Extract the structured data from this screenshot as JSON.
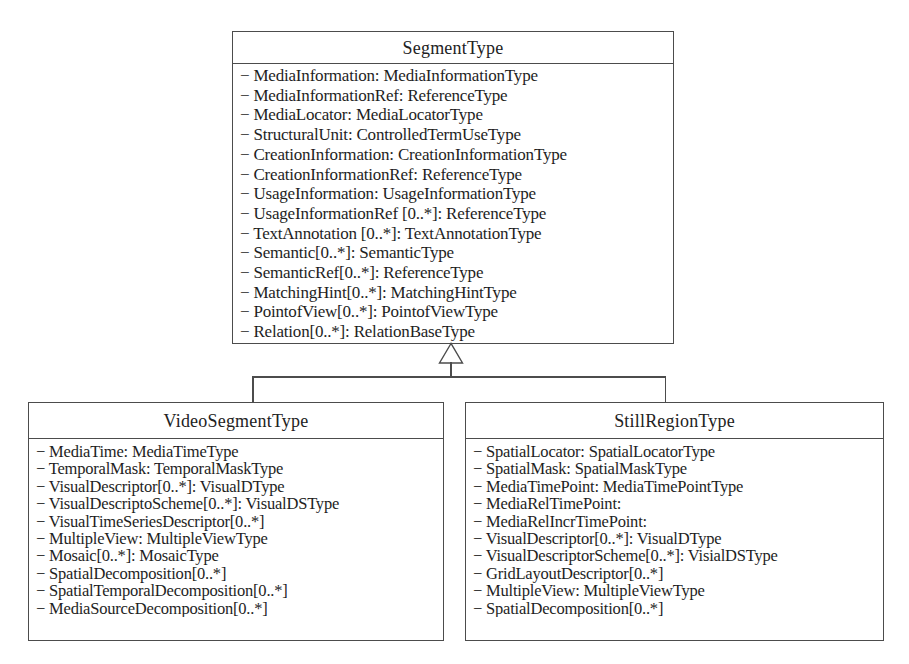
{
  "diagram": {
    "type": "uml-class-diagram",
    "background_color": "#ffffff",
    "line_color": "#4c4c4c",
    "text_color": "#1e1e1e",
    "classes": [
      {
        "name": "SegmentType",
        "attributes": [
          "− MediaInformation: MediaInformationType",
          "− MediaInformationRef: ReferenceType",
          "− MediaLocator: MediaLocatorType",
          "− StructuralUnit: ControlledTermUseType",
          "− CreationInformation: CreationInformationType",
          "− CreationInformationRef: ReferenceType",
          "− UsageInformation: UsageInformationType",
          "− UsageInformationRef [0..*]: ReferenceType",
          "− TextAnnotation [0..*]: TextAnnotationType",
          "− Semantic[0..*]: SemanticType",
          "− SemanticRef[0..*]: ReferenceType",
          "− MatchingHint[0..*]: MatchingHintType",
          "− PointofView[0..*]: PointofViewType",
          "− Relation[0..*]: RelationBaseType"
        ]
      },
      {
        "name": "VideoSegmentType",
        "attributes": [
          "− MediaTime: MediaTimeType",
          "− TemporalMask: TemporalMaskType",
          "− VisualDescriptor[0..*]: VisualDType",
          "− VisualDescriptoScheme[0..*]: VisualDSType",
          "− VisualTimeSeriesDescriptor[0..*]",
          "− MultipleView: MultipleViewType",
          "− Mosaic[0..*]: MosaicType",
          "− SpatialDecomposition[0..*]",
          "− SpatialTemporalDecomposition[0..*]",
          "− MediaSourceDecomposition[0..*]"
        ]
      },
      {
        "name": "StillRegionType",
        "attributes": [
          "− SpatialLocator: SpatialLocatorType",
          "− SpatialMask: SpatialMaskType",
          "− MediaTimePoint: MediaTimePointType",
          "− MediaRelTimePoint:",
          "− MediaRelIncrTimePoint:",
          "− VisualDescriptor[0..*]: VisualDType",
          "− VisualDescriptorScheme[0..*]: VisialDSType",
          "− GridLayoutDescriptor[0..*]",
          "− MultipleView: MultipleViewType",
          "− SpatialDecomposition[0..*]"
        ]
      }
    ],
    "relationships": [
      {
        "type": "generalization",
        "from": "VideoSegmentType",
        "to": "SegmentType"
      },
      {
        "type": "generalization",
        "from": "StillRegionType",
        "to": "SegmentType"
      }
    ]
  }
}
